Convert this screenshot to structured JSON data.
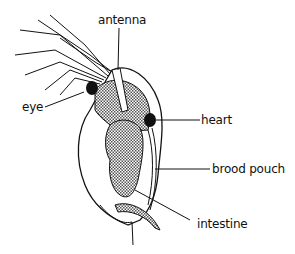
{
  "diagram": {
    "labels": {
      "antenna": "antenna",
      "eye": "eye",
      "heart": "heart",
      "brood_pouch": "brood pouch",
      "intestine": "intestine"
    },
    "colors": {
      "line": "#111111",
      "shading": "#9a9a9a",
      "background": "#ffffff"
    }
  }
}
